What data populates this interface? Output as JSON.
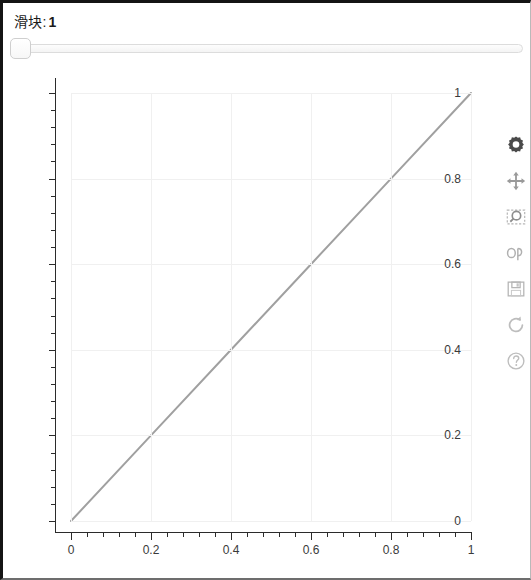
{
  "window": {
    "title": "滑块: 1"
  },
  "slider": {
    "label_text": "滑块:",
    "value": "1",
    "handle_position_percent": 0,
    "min": "0",
    "max": "1"
  },
  "toolbar": {
    "items": [
      {
        "name": "configure-subplots-icon",
        "label": "Configure subplots"
      },
      {
        "name": "pan-icon",
        "label": "Pan"
      },
      {
        "name": "zoom-to-rect-icon",
        "label": "Zoom to rectangle"
      },
      {
        "name": "edit-axis-curve-icon",
        "label": "Edit axis, curve and image parameters"
      },
      {
        "name": "save-icon",
        "label": "Save the figure"
      },
      {
        "name": "reset-icon",
        "label": "Reset original view"
      },
      {
        "name": "help-icon",
        "label": "Help"
      }
    ]
  },
  "chart_data": {
    "type": "line",
    "title": "",
    "xlabel": "",
    "ylabel": "",
    "xlim": [
      -0.05,
      1.05
    ],
    "ylim": [
      -0.05,
      1.05
    ],
    "grid": true,
    "legend": null,
    "x_ticks": [
      "0",
      "0.2",
      "0.4",
      "0.6",
      "0.8",
      "1"
    ],
    "x_tick_values": [
      0,
      0.2,
      0.4,
      0.6,
      0.8,
      1
    ],
    "y_ticks": [
      "0",
      "0.2",
      "0.4",
      "0.6",
      "0.8",
      "1"
    ],
    "y_tick_values": [
      0,
      0.2,
      0.4,
      0.6,
      0.8,
      1
    ],
    "minor_ticks_per_interval": 4,
    "line_color": "#a0a0a0",
    "line_width": 2,
    "series": [
      {
        "name": "y = x",
        "x": [
          0,
          0.2,
          0.4,
          0.6,
          0.8,
          1
        ],
        "values": [
          0,
          0.2,
          0.4,
          0.6,
          0.8,
          1
        ]
      }
    ]
  }
}
